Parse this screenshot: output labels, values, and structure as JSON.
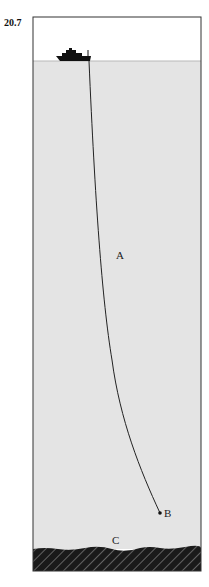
{
  "figure": {
    "number": "20.7",
    "labels": {
      "A": "A",
      "B": "B",
      "C": "C"
    },
    "colors": {
      "sky": "#ffffff",
      "water": "#e4e4e4",
      "frame": "#333333",
      "cable": "#222222",
      "ship": "#111111",
      "seabed": "#1a1a1a",
      "seabed_hatch": "#888888"
    },
    "elements": {
      "ship": "ship-icon",
      "cable": "cable from ship to point B",
      "point_B": "cable end point",
      "seabed": "hatched sea floor labeled C"
    }
  }
}
